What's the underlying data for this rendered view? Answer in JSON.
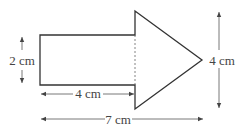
{
  "diagram": {
    "type": "arrow-shape-composite",
    "colors": {
      "stroke": "#333333",
      "dim_line": "#555555",
      "text": "#444444",
      "background": "#ffffff"
    },
    "labels": {
      "rect_height": "2 cm",
      "rect_width": "4 cm",
      "total_width": "7 cm",
      "triangle_height": "4 cm"
    },
    "shapes": {
      "rectangle": {
        "width_cm": 4,
        "height_cm": 2
      },
      "triangle": {
        "base_cm": 4,
        "height_cm": 3
      }
    }
  }
}
